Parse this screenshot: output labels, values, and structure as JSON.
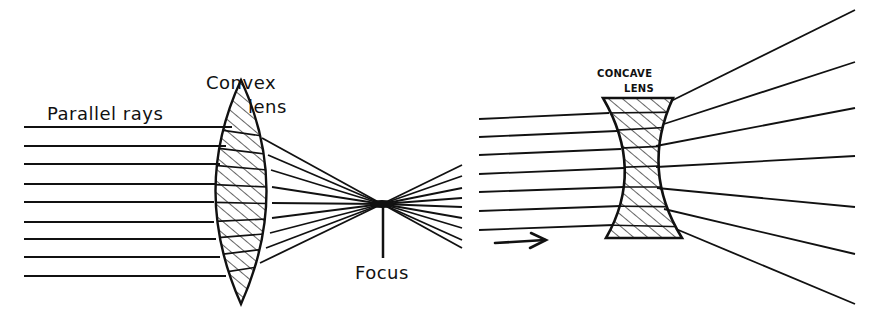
{
  "diagram": {
    "convex": {
      "label_lens_line1": "Convex",
      "label_lens_line2": "lens",
      "label_rays": "Parallel rays",
      "label_focus": "Focus"
    },
    "concave": {
      "label_line1": "CONCAVE",
      "label_line2": "LENS"
    },
    "colors": {
      "ink": "#111111",
      "background": "#ffffff"
    }
  }
}
